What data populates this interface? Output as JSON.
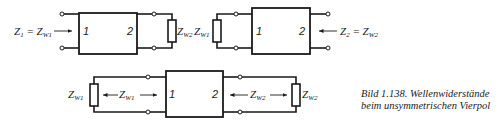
{
  "figure": {
    "caption_line1": "Bild 1.138. Wellenwiderstände",
    "caption_line2": "beim unsymmetrischen Vierpol"
  },
  "diagrams": {
    "top_left": {
      "input_label_main": "Z",
      "input_label_sub": "1",
      "input_label_eq": " = ",
      "input_label_main2": "Z",
      "input_label_sub2": "W1",
      "port_left": "1",
      "port_right": "2",
      "load_label_main": "Z",
      "load_label_sub": "W2"
    },
    "top_right": {
      "load_label_main": "Z",
      "load_label_sub": "W1",
      "port_left": "1",
      "port_right": "2",
      "input_label_main": "Z",
      "input_label_sub": "2",
      "input_label_eq": " = ",
      "input_label_main2": "Z",
      "input_label_sub2": "W2"
    },
    "bottom": {
      "left_load_main": "Z",
      "left_load_sub": "W1",
      "left_arrow_main": "Z",
      "left_arrow_sub": "W1",
      "port_left": "1",
      "port_right": "2",
      "right_arrow_main": "Z",
      "right_arrow_sub": "W2",
      "right_load_main": "Z",
      "right_load_sub": "W2"
    }
  },
  "colors": {
    "ink": "#1a1a1a",
    "background": "#ffffff"
  }
}
